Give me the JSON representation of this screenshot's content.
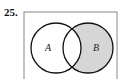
{
  "problem": {
    "number": "25."
  },
  "diagram": {
    "type": "venn",
    "universe": {
      "x": 24,
      "y": 12,
      "width": 93,
      "height": 70,
      "stroke": "#888888"
    },
    "sets": [
      {
        "label": "A",
        "cx": 56,
        "cy": 48,
        "r": 25,
        "label_x": 48,
        "label_y": 51
      },
      {
        "label": "B",
        "cx": 88,
        "cy": 48,
        "r": 25,
        "label_x": 96,
        "label_y": 51
      }
    ],
    "shaded_region": "B minus A",
    "colors": {
      "shade": "#d6d6d6",
      "stroke": "#111111",
      "background": "#ffffff"
    }
  }
}
